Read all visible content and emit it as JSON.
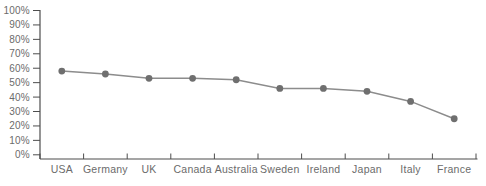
{
  "chart_data": {
    "type": "line",
    "categories": [
      "USA",
      "Germany",
      "UK",
      "Canada",
      "Australia",
      "Sweden",
      "Ireland",
      "Japan",
      "Italy",
      "France"
    ],
    "values": [
      58,
      56,
      53,
      53,
      52,
      46,
      46,
      44,
      37,
      25
    ],
    "title": "",
    "xlabel": "",
    "ylabel": "",
    "ylim": [
      0,
      100
    ],
    "ytick_step": 10,
    "ytick_labels": [
      "0%",
      "10%",
      "20%",
      "30%",
      "40%",
      "50%",
      "60%",
      "70%",
      "80%",
      "90%",
      "100%"
    ],
    "grid": false,
    "legend_position": "none",
    "colors": {
      "line": "#8c8c8c",
      "marker": "#6f6f6f",
      "axis": "#4d4d4d",
      "tick": "#4d4d4d",
      "label_text": "#6b6b6b",
      "background": "#ffffff"
    }
  }
}
